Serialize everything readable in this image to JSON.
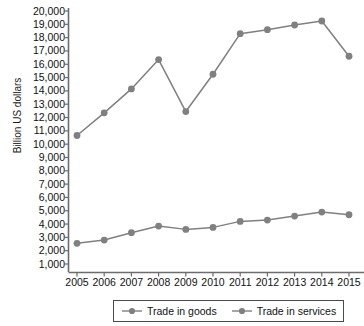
{
  "chart_data": {
    "type": "line",
    "title": "",
    "xlabel": "",
    "ylabel": "Billion US dollars",
    "categories": [
      "2005",
      "2006",
      "2007",
      "2008",
      "2009",
      "2010",
      "2011",
      "2012",
      "2013",
      "2014",
      "2015"
    ],
    "x": [
      2005,
      2006,
      2007,
      2008,
      2009,
      2010,
      2011,
      2012,
      2013,
      2014,
      2015
    ],
    "ylim": [
      1000,
      20000
    ],
    "ytick_step": 1000,
    "ytick_labels": [
      "20,000",
      "19,000",
      "18,000",
      "17,000",
      "16,000",
      "15,000",
      "14,000",
      "13,000",
      "12,000",
      "11,000",
      "10,000",
      "9,000",
      "8,000",
      "7,000",
      "6,000",
      "5,000",
      "4,000",
      "3,000",
      "2,000",
      "1,000"
    ],
    "grid": false,
    "legend_position": "bottom",
    "series": [
      {
        "name": "Trade in goods",
        "color": "#808080",
        "values": [
          10650,
          12350,
          14150,
          16350,
          12450,
          15250,
          18300,
          18600,
          18950,
          19250,
          16600
        ]
      },
      {
        "name": "Trade in services",
        "color": "#808080",
        "values": [
          2550,
          2800,
          3350,
          3850,
          3600,
          3750,
          4200,
          4300,
          4600,
          4900,
          4700
        ]
      }
    ]
  },
  "axis": {
    "y_title": "Billion US dollars"
  },
  "legend": {
    "items": [
      {
        "label": "Trade in goods"
      },
      {
        "label": "Trade in services"
      }
    ]
  }
}
